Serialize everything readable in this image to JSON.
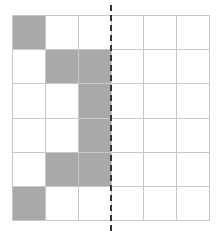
{
  "diagram": {
    "type": "symmetry-grid",
    "rows": 6,
    "cols": 6,
    "fill_color": "#a9a9a9",
    "grid_line_color": "#c8c8c8",
    "axis": {
      "style": "dashed",
      "orientation": "vertical",
      "position_after_col": 3,
      "color": "#333333"
    },
    "filled_cells": [
      [
        0,
        0
      ],
      [
        1,
        1
      ],
      [
        1,
        2
      ],
      [
        2,
        2
      ],
      [
        3,
        2
      ],
      [
        4,
        1
      ],
      [
        4,
        2
      ],
      [
        5,
        0
      ]
    ]
  }
}
